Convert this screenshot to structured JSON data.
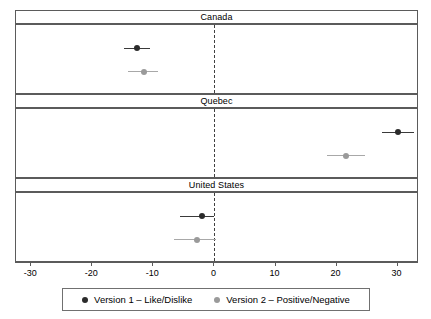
{
  "chart_data": {
    "type": "scatter",
    "subtype": "forest-plot-coefficient-plot",
    "title": "",
    "subtitle": "",
    "xlabel": "",
    "ylabel": "",
    "xlim": [
      -32.5,
      33.5
    ],
    "xticks": [
      -30,
      -20,
      -10,
      0,
      10,
      20,
      30
    ],
    "xtick_labels": [
      "-30",
      "-20",
      "-10",
      "0",
      "10",
      "20",
      "30"
    ],
    "grid": false,
    "zero_reference_line": 0,
    "zero_line_style": "dashed",
    "legend_position": "bottom",
    "panels": [
      {
        "label": "Canada",
        "series": [
          {
            "name": "Version 1 – Like/Dislike",
            "estimate": -12.7,
            "ci_low": -14.8,
            "ci_high": -10.6,
            "color": "#2b2b2b"
          },
          {
            "name": "Version 2 – Positive/Negative",
            "estimate": -11.6,
            "ci_low": -14.2,
            "ci_high": -9.2,
            "color": "#9a9a9a"
          }
        ]
      },
      {
        "label": "Quebec",
        "series": [
          {
            "name": "Version 1 – Like/Dislike",
            "estimate": 30.0,
            "ci_low": 27.4,
            "ci_high": 32.6,
            "color": "#2b2b2b"
          },
          {
            "name": "Version 2 – Positive/Negative",
            "estimate": 21.6,
            "ci_low": 18.4,
            "ci_high": 24.6,
            "color": "#9a9a9a"
          }
        ]
      },
      {
        "label": "United States",
        "series": [
          {
            "name": "Version 1 – Like/Dislike",
            "estimate": -2.1,
            "ci_low": -5.6,
            "ci_high": 0.0,
            "color": "#2b2b2b"
          },
          {
            "name": "Version 2 – Positive/Negative",
            "estimate": -2.8,
            "ci_low": -6.6,
            "ci_high": 0.2,
            "color": "#9a9a9a"
          }
        ]
      }
    ],
    "legend": [
      {
        "label": "Version 1 – Like/Dislike",
        "color": "#2b2b2b"
      },
      {
        "label": "Version 2 – Positive/Negative",
        "color": "#9a9a9a"
      }
    ]
  },
  "colors": {
    "version1": "#2b2b2b",
    "version2": "#9a9a9a",
    "frame": "#5b5b5b",
    "zero_line": "#404040",
    "background": "#ffffff"
  }
}
